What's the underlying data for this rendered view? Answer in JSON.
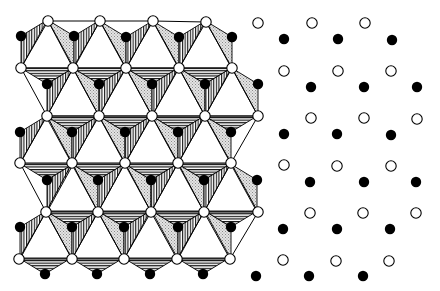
{
  "figure": {
    "description": "Octahedral layer (polyhedral view) beside its ball-only projection: open circles = anions, filled circles = cations",
    "colors": {
      "background": "#ffffff",
      "line": "#000000",
      "stipple": "#c8c8c8"
    },
    "left_panel": {
      "name": "polyhedral-layer",
      "open_vertices": [
        [
          48,
          21
        ],
        [
          100,
          21
        ],
        [
          153,
          21
        ],
        [
          206,
          22
        ],
        [
          21,
          68
        ],
        [
          73,
          68
        ],
        [
          126,
          68
        ],
        [
          179,
          68
        ],
        [
          232,
          68
        ],
        [
          47,
          116
        ],
        [
          99,
          116
        ],
        [
          152,
          116
        ],
        [
          205,
          116
        ],
        [
          258,
          116
        ],
        [
          20,
          163
        ],
        [
          72,
          163
        ],
        [
          125,
          163
        ],
        [
          178,
          163
        ],
        [
          231,
          163
        ],
        [
          46,
          212
        ],
        [
          98,
          212
        ],
        [
          151,
          212
        ],
        [
          204,
          212
        ],
        [
          258,
          212
        ],
        [
          19,
          259
        ],
        [
          72,
          259
        ],
        [
          124,
          259
        ],
        [
          177,
          259
        ],
        [
          230,
          259
        ]
      ],
      "filled_centers": [
        {
          "p": [
            21,
            36
          ],
          "faces": [
            "right"
          ]
        },
        {
          "p": [
            74,
            36
          ],
          "faces": [
            "left",
            "right"
          ]
        },
        {
          "p": [
            126,
            37
          ],
          "faces": [
            "left",
            "right"
          ]
        },
        {
          "p": [
            179,
            37
          ],
          "faces": [
            "left",
            "right"
          ]
        },
        {
          "p": [
            232,
            37
          ],
          "faces": [
            "left"
          ]
        },
        {
          "p": [
            47,
            84
          ],
          "faces": [
            "top",
            "right"
          ]
        },
        {
          "p": [
            99,
            84
          ],
          "faces": [
            "top",
            "left",
            "right"
          ]
        },
        {
          "p": [
            152,
            84
          ],
          "faces": [
            "top",
            "left",
            "right"
          ]
        },
        {
          "p": [
            205,
            84
          ],
          "faces": [
            "top",
            "left",
            "right"
          ]
        },
        {
          "p": [
            258,
            84
          ],
          "faces": [
            "left"
          ]
        },
        {
          "p": [
            20,
            132
          ],
          "faces": [
            "right"
          ]
        },
        {
          "p": [
            72,
            132
          ],
          "faces": [
            "top",
            "left",
            "right"
          ]
        },
        {
          "p": [
            125,
            132
          ],
          "faces": [
            "top",
            "left",
            "right"
          ]
        },
        {
          "p": [
            178,
            132
          ],
          "faces": [
            "top",
            "left",
            "right"
          ]
        },
        {
          "p": [
            231,
            132
          ],
          "faces": [
            "top",
            "left"
          ]
        },
        {
          "p": [
            47,
            180
          ],
          "faces": [
            "top",
            "right"
          ]
        },
        {
          "p": [
            98,
            180
          ],
          "faces": [
            "top",
            "left",
            "right"
          ]
        },
        {
          "p": [
            151,
            180
          ],
          "faces": [
            "top",
            "left",
            "right"
          ]
        },
        {
          "p": [
            204,
            180
          ],
          "faces": [
            "top",
            "left",
            "right"
          ]
        },
        {
          "p": [
            257,
            180
          ],
          "faces": [
            "left"
          ]
        },
        {
          "p": [
            20,
            227
          ],
          "faces": [
            "right"
          ]
        },
        {
          "p": [
            72,
            227
          ],
          "faces": [
            "top",
            "left",
            "right"
          ]
        },
        {
          "p": [
            124,
            227
          ],
          "faces": [
            "top",
            "left",
            "right"
          ]
        },
        {
          "p": [
            178,
            227
          ],
          "faces": [
            "top",
            "left",
            "right"
          ]
        },
        {
          "p": [
            231,
            227
          ],
          "faces": [
            "top",
            "left"
          ]
        },
        {
          "p": [
            45,
            274
          ],
          "faces": [
            "top"
          ]
        },
        {
          "p": [
            97,
            274
          ],
          "faces": [
            "top"
          ]
        },
        {
          "p": [
            150,
            274
          ],
          "faces": [
            "top"
          ]
        },
        {
          "p": [
            203,
            274
          ],
          "faces": [
            "top"
          ]
        }
      ],
      "face_offsets": {
        "half_width": 26.3,
        "up": 16,
        "down": 32
      },
      "face_fills": {
        "top": "hatch-horizontal",
        "left": "stipple",
        "right": "hatch-vertical"
      }
    },
    "right_panel": {
      "name": "ball-projection",
      "open_circles": [
        [
          258,
          23
        ],
        [
          312,
          23
        ],
        [
          365,
          23
        ],
        [
          284,
          71
        ],
        [
          338,
          71
        ],
        [
          391,
          71
        ],
        [
          311,
          118
        ],
        [
          364,
          118
        ],
        [
          417,
          119
        ],
        [
          284,
          165
        ],
        [
          337,
          166
        ],
        [
          391,
          166
        ],
        [
          310,
          213
        ],
        [
          363,
          213
        ],
        [
          416,
          213
        ],
        [
          283,
          260
        ],
        [
          336,
          261
        ],
        [
          389,
          261
        ]
      ],
      "filled_circles": [
        [
          284,
          39
        ],
        [
          338,
          39
        ],
        [
          392,
          40
        ],
        [
          311,
          87
        ],
        [
          364,
          87
        ],
        [
          417,
          87
        ],
        [
          284,
          134
        ],
        [
          337,
          134
        ],
        [
          391,
          135
        ],
        [
          310,
          182
        ],
        [
          364,
          182
        ],
        [
          416,
          182
        ],
        [
          283,
          229
        ],
        [
          337,
          229
        ],
        [
          390,
          229
        ],
        [
          256,
          276
        ],
        [
          309,
          276
        ],
        [
          363,
          276
        ]
      ]
    },
    "radii": {
      "open": 5.2,
      "filled": 5.2
    }
  }
}
